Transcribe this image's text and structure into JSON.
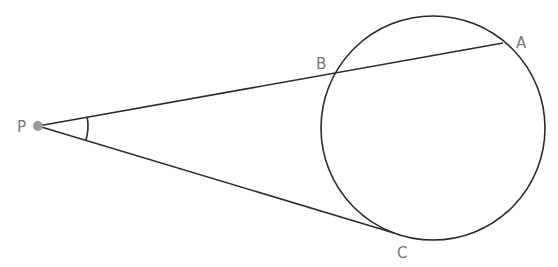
{
  "diagram": {
    "colors": {
      "line": "#2b2b2b",
      "point": "#9a9a9a",
      "label": "#777777",
      "background": "#ffffff"
    },
    "circle": {
      "cx": 433,
      "cy": 128,
      "r": 112
    },
    "points": {
      "P": {
        "label": "P",
        "x": 38,
        "y": 126
      },
      "A": {
        "label": "A",
        "x": 503,
        "y": 43
      },
      "B": {
        "label": "B",
        "x": 338,
        "y": 71
      },
      "C": {
        "label": "C",
        "x": 394,
        "y": 233
      }
    },
    "segments": [
      {
        "from": "P",
        "to": "A",
        "type": "secant"
      },
      {
        "from": "P",
        "to": "C",
        "type": "tangent"
      }
    ],
    "angle_marker": {
      "vertex": "P",
      "radius": 50
    }
  }
}
